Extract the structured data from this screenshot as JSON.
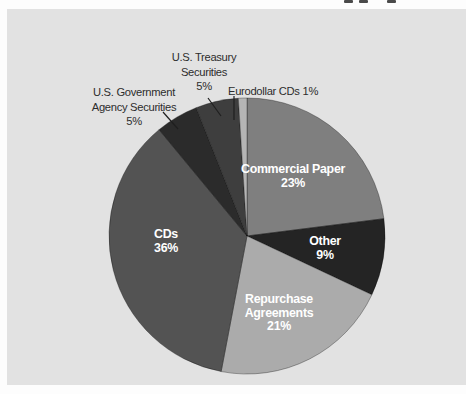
{
  "figure": {
    "background_color": "#fdfdfd",
    "panel_color": "#e2e2e2"
  },
  "chart_data": {
    "type": "pie",
    "title": "",
    "direction": "clockwise",
    "start_angle_from_top_deg": 0,
    "legend": "none",
    "slices": [
      {
        "label": "Commercial Paper",
        "value_pct": 23,
        "color": "#7f7f7f",
        "label_placement": "inside"
      },
      {
        "label": "Other",
        "value_pct": 9,
        "color": "#242424",
        "label_placement": "inside"
      },
      {
        "label": "Repurchase Agreements",
        "value_pct": 21,
        "color": "#ababab",
        "label_placement": "inside"
      },
      {
        "label": "CDs",
        "value_pct": 36,
        "color": "#535353",
        "label_placement": "inside"
      },
      {
        "label": "U.S. Government Agency Securities",
        "value_pct": 5,
        "color": "#2b2b2b",
        "label_placement": "outside"
      },
      {
        "label": "U.S. Treasury Securities",
        "value_pct": 5,
        "color": "#3e3e3e",
        "label_placement": "outside"
      },
      {
        "label": "Eurodollar CDs",
        "value_pct": 1,
        "color": "#b5b5b5",
        "label_placement": "outside"
      }
    ]
  },
  "labels": {
    "commercial_paper": "Commercial Paper\n23%",
    "other": "Other\n9%",
    "repurchase": "Repurchase\nAgreements\n21%",
    "cds": "CDs\n36%",
    "agency": "U.S. Government\nAgency Securities\n5%",
    "treasury": "U.S. Treasury\nSecurities\n5%",
    "eurodollar": "Eurodollar CDs 1%"
  }
}
